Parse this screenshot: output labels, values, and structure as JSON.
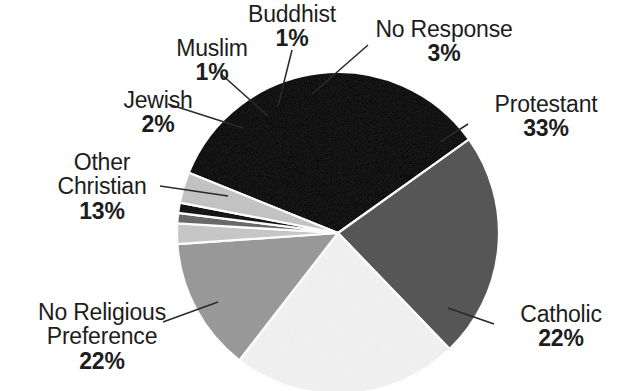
{
  "chart_data": {
    "type": "pie",
    "title": "",
    "subtitle": "",
    "xlabel": "",
    "ylabel": "",
    "legend_position": "none",
    "grid": false,
    "units": "percent",
    "total": 97,
    "start_angle_deg": -68,
    "direction": "clockwise",
    "categories": [
      "Protestant",
      "Catholic",
      "No Religious Preference",
      "Other Christian",
      "Jewish",
      "Muslim",
      "Buddhist",
      "No Response"
    ],
    "values": [
      33,
      22,
      22,
      13,
      2,
      1,
      1,
      3
    ],
    "value_labels": [
      "33%",
      "22%",
      "22%",
      "13%",
      "2%",
      "1%",
      "1%",
      "3%"
    ],
    "colors": [
      "#121212",
      "#585858",
      "#f2f2f2",
      "#9a9a9a",
      "#c8c8c8",
      "#6a6a6a",
      "#141414",
      "#c4c4c4"
    ],
    "slices": [
      {
        "name": "Protestant",
        "value": 33,
        "value_label": "33%",
        "color": "#121212"
      },
      {
        "name": "Catholic",
        "value": 22,
        "value_label": "22%",
        "color": "#585858"
      },
      {
        "name": "No Religious Preference",
        "value": 22,
        "value_label": "22%",
        "color": "#f2f2f2"
      },
      {
        "name": "Other Christian",
        "value": 13,
        "value_label": "13%",
        "color": "#9a9a9a"
      },
      {
        "name": "Jewish",
        "value": 2,
        "value_label": "2%",
        "color": "#c8c8c8"
      },
      {
        "name": "Muslim",
        "value": 1,
        "value_label": "1%",
        "color": "#6a6a6a"
      },
      {
        "name": "Buddhist",
        "value": 1,
        "value_label": "1%",
        "color": "#141414"
      },
      {
        "name": "No Response",
        "value": 3,
        "value_label": "3%",
        "color": "#c4c4c4"
      }
    ]
  },
  "labels": {
    "buddhist": {
      "name": "Buddhist",
      "pct": "1%"
    },
    "muslim": {
      "name": "Muslim",
      "pct": "1%"
    },
    "jewish": {
      "name": "Jewish",
      "pct": "2%"
    },
    "other_christian": {
      "name_line1": "Other",
      "name_line2": "Christian",
      "pct": "13%"
    },
    "no_religious": {
      "name_line1": "No Religious",
      "name_line2": "Preference",
      "pct": "22%"
    },
    "no_response": {
      "name": "No Response",
      "pct": "3%"
    },
    "protestant": {
      "name": "Protestant",
      "pct": "33%"
    },
    "catholic": {
      "name": "Catholic",
      "pct": "22%"
    }
  },
  "style": {
    "background": "#ffffff",
    "text_color": "#1d1d1d",
    "leader_line_color": "#2a2a2a"
  }
}
